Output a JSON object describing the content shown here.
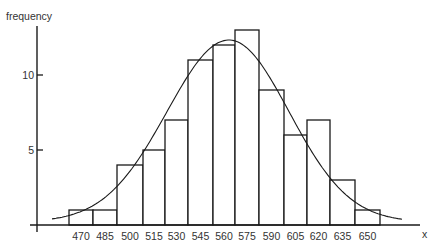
{
  "chart_data": {
    "type": "bar",
    "subtype": "histogram-with-normal-curve",
    "title": "",
    "xlabel": "x",
    "ylabel": "frequency",
    "categories": [
      "470",
      "485",
      "500",
      "515",
      "530",
      "545",
      "560",
      "575",
      "590",
      "605",
      "620",
      "635",
      "650"
    ],
    "values": [
      1,
      1,
      4,
      5,
      7,
      11,
      12,
      13,
      9,
      6,
      7,
      3,
      1
    ],
    "yticks": [
      5,
      10
    ],
    "ylim": [
      0,
      13.5
    ],
    "grid": false,
    "legend": null,
    "overlay": {
      "type": "line",
      "name": "fitted normal curve",
      "peak_x": 562,
      "peak_y": 12.3
    },
    "colors": {
      "bar_fill": "#ffffff",
      "bar_stroke": "#1a1a1a",
      "axis": "#1a1a1a",
      "curve": "#1a1a1a"
    }
  }
}
